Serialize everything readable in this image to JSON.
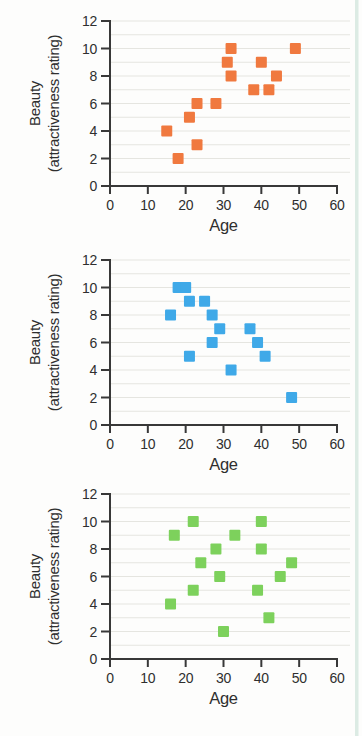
{
  "figure": {
    "background": "#fdfdfc",
    "page_edge_color": "#dcebe4",
    "axis_color": "#383838",
    "grid_color": "#e5e5e0",
    "text_color": "#2f2f2f"
  },
  "chart_data": [
    {
      "type": "scatter",
      "name": "positive-correlation",
      "title": "",
      "xlabel": "Age",
      "ylabel": "Beauty (attractiveness rating)",
      "ylabel_lines": [
        "Beauty",
        "(attractiveness rating)"
      ],
      "xlim": [
        0,
        60
      ],
      "ylim": [
        0,
        12
      ],
      "xticks": [
        0,
        10,
        20,
        30,
        40,
        50,
        60
      ],
      "yticks": [
        0,
        2,
        4,
        6,
        8,
        10,
        12
      ],
      "grid": "horizontal lines at every 1 unit, light",
      "legend": "none",
      "marker": "square",
      "marker_color": "#F0793F",
      "points": [
        [
          15,
          4
        ],
        [
          18,
          2
        ],
        [
          21,
          5
        ],
        [
          23,
          3
        ],
        [
          23,
          6
        ],
        [
          28,
          6
        ],
        [
          31,
          9
        ],
        [
          32,
          8
        ],
        [
          32,
          10
        ],
        [
          38,
          7
        ],
        [
          40,
          9
        ],
        [
          42,
          7
        ],
        [
          44,
          8
        ],
        [
          49,
          10
        ]
      ]
    },
    {
      "type": "scatter",
      "name": "negative-correlation",
      "title": "",
      "xlabel": "Age",
      "ylabel": "Beauty (attractiveness rating)",
      "ylabel_lines": [
        "Beauty",
        "(attractiveness rating)"
      ],
      "xlim": [
        0,
        60
      ],
      "ylim": [
        0,
        12
      ],
      "xticks": [
        0,
        10,
        20,
        30,
        40,
        50,
        60
      ],
      "yticks": [
        0,
        2,
        4,
        6,
        8,
        10,
        12
      ],
      "grid": "horizontal lines at every 1 unit, light",
      "legend": "none",
      "marker": "square",
      "marker_color": "#3FA9E8",
      "points": [
        [
          16,
          8
        ],
        [
          18,
          10
        ],
        [
          20,
          10
        ],
        [
          21,
          9
        ],
        [
          25,
          9
        ],
        [
          27,
          8
        ],
        [
          29,
          7
        ],
        [
          27,
          6
        ],
        [
          37,
          7
        ],
        [
          39,
          6
        ],
        [
          21,
          5
        ],
        [
          41,
          5
        ],
        [
          32,
          4
        ],
        [
          48,
          2
        ]
      ]
    },
    {
      "type": "scatter",
      "name": "no-correlation",
      "title": "",
      "xlabel": "Age",
      "ylabel": "Beauty (attractiveness rating)",
      "ylabel_lines": [
        "Beauty",
        "(attractiveness rating)"
      ],
      "xlim": [
        0,
        60
      ],
      "ylim": [
        0,
        12
      ],
      "xticks": [
        0,
        10,
        20,
        30,
        40,
        50,
        60
      ],
      "yticks": [
        0,
        2,
        4,
        6,
        8,
        10,
        12
      ],
      "grid": "horizontal lines at every 1 unit, light",
      "legend": "none",
      "marker": "square",
      "marker_color": "#7DD15C",
      "points": [
        [
          16,
          4
        ],
        [
          17,
          9
        ],
        [
          22,
          5
        ],
        [
          22,
          10
        ],
        [
          24,
          7
        ],
        [
          28,
          8
        ],
        [
          29,
          6
        ],
        [
          30,
          2
        ],
        [
          33,
          9
        ],
        [
          39,
          5
        ],
        [
          40,
          8
        ],
        [
          40,
          10
        ],
        [
          42,
          3
        ],
        [
          45,
          6
        ],
        [
          48,
          7
        ]
      ]
    }
  ]
}
